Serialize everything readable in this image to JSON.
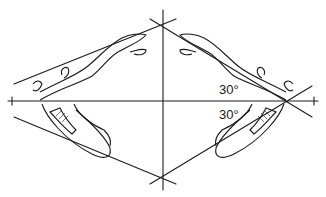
{
  "diagram": {
    "angle_labels": [
      {
        "text": "30°",
        "position": "above horizontal, right side"
      },
      {
        "text": "30°",
        "position": "below horizontal, right side"
      }
    ],
    "colors": {
      "line": "#1a1a1a",
      "background": "#ffffff"
    }
  }
}
